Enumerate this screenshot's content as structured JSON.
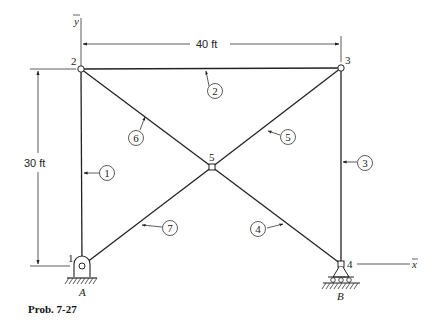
{
  "figure": {
    "caption": "Prob. 7-27",
    "axes": {
      "y_label": "y",
      "x_label": "x"
    },
    "dimensions": {
      "width": "40 ft",
      "height": "30 ft"
    },
    "supports": {
      "left": "A",
      "right": "B"
    },
    "nodes": [
      {
        "id": "1",
        "label": "1",
        "x": 82,
        "y": 266
      },
      {
        "id": "2",
        "label": "2",
        "x": 81,
        "y": 69
      },
      {
        "id": "3",
        "label": "3",
        "x": 341,
        "y": 68
      },
      {
        "id": "4",
        "label": "4",
        "x": 341,
        "y": 264
      },
      {
        "id": "5",
        "label": "5",
        "x": 212,
        "y": 167
      }
    ],
    "members": [
      {
        "id": "1",
        "label": "1",
        "from": "1",
        "to": "2"
      },
      {
        "id": "2",
        "label": "2",
        "from": "2",
        "to": "3"
      },
      {
        "id": "3",
        "label": "3",
        "from": "3",
        "to": "4"
      },
      {
        "id": "4",
        "label": "4",
        "from": "5",
        "to": "4"
      },
      {
        "id": "5",
        "label": "5",
        "from": "5",
        "to": "3"
      },
      {
        "id": "6",
        "label": "6",
        "from": "2",
        "to": "5"
      },
      {
        "id": "7",
        "label": "7",
        "from": "1",
        "to": "5"
      }
    ]
  }
}
